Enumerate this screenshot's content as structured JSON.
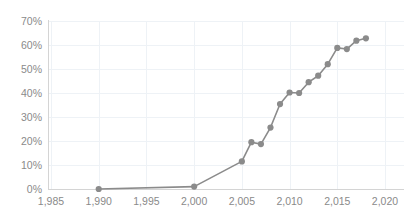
{
  "chart_data": {
    "type": "line",
    "title": "",
    "subtitle": "",
    "xlabel": "",
    "ylabel": "",
    "xlim": [
      1985,
      2020
    ],
    "ylim": [
      0,
      0.7
    ],
    "grid": true,
    "legend": false,
    "legend_position": "none",
    "x_tick_labels": [
      "1,985",
      "1,990",
      "1,995",
      "2,000",
      "2,005",
      "2,010",
      "2,015",
      "2,020"
    ],
    "x_ticks": [
      1985,
      1990,
      1995,
      2000,
      2005,
      2010,
      2015,
      2020
    ],
    "y_tick_labels": [
      "0%",
      "10%",
      "20%",
      "30%",
      "40%",
      "50%",
      "60%",
      "70%"
    ],
    "y_ticks": [
      0,
      0.1,
      0.2,
      0.3,
      0.4,
      0.5,
      0.6,
      0.7
    ],
    "series": [
      {
        "name": "Series 1",
        "color": "#8b8b8b",
        "marker": "circle",
        "x": [
          1990,
          2000,
          2005,
          2006,
          2007,
          2008,
          2009,
          2010,
          2011,
          2012,
          2013,
          2014,
          2015,
          2016,
          2017,
          2018
        ],
        "values": [
          0.0,
          0.01,
          0.115,
          0.195,
          0.187,
          0.256,
          0.354,
          0.402,
          0.4,
          0.445,
          0.472,
          0.52,
          0.588,
          0.583,
          0.618,
          0.628
        ],
        "value_labels": [
          "0%",
          "1%",
          "11.5%",
          "19.5%",
          "18.7%",
          "25.6%",
          "35.4%",
          "40.2%",
          "40%",
          "44.5%",
          "47.2%",
          "52%",
          "58.8%",
          "58.3%",
          "61.8%",
          "62.8%"
        ]
      }
    ]
  },
  "style": {
    "background": "#ffffff",
    "grid_color": "#eef2f6",
    "axis_color": "#d4d4d4",
    "tick_label_color": "#8a8a8a",
    "series_color": "#8b8b8b"
  }
}
